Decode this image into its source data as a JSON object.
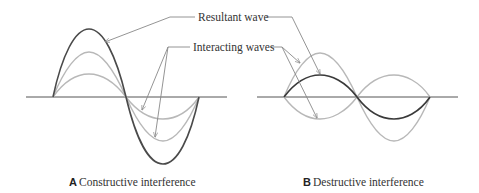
{
  "labels": {
    "resultant": "Resultant wave",
    "interacting": "Interacting waves"
  },
  "panels": [
    {
      "letter": "A",
      "caption": "Constructive interference"
    },
    {
      "letter": "B",
      "caption": "Destructive interference"
    }
  ],
  "colors": {
    "resultant": "#4a4a4a",
    "interacting": "#b8b8b8",
    "axis": "#555555",
    "leader": "#888888"
  }
}
